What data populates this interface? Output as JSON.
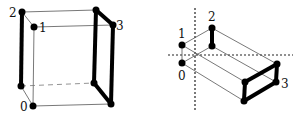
{
  "figures": [
    {
      "name": "cube-left",
      "labels": {
        "p0": "0",
        "p1": "1",
        "p2": "2",
        "p3": "3"
      }
    },
    {
      "name": "box-right",
      "labels": {
        "p0": "0",
        "p1": "1",
        "p2": "2",
        "p3": "3"
      }
    }
  ],
  "colors": {
    "thick": "#000000",
    "thin": "#444444",
    "dashed": "#222222"
  }
}
